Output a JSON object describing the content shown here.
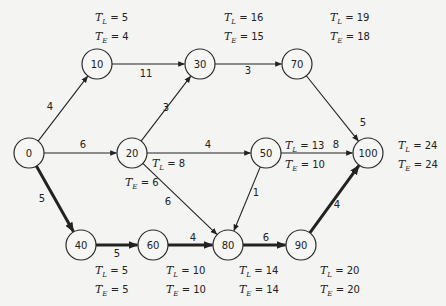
{
  "diagram": {
    "type": "PERT network",
    "nodes": [
      {
        "id": "0",
        "x": 29,
        "y": 153
      },
      {
        "id": "10",
        "x": 97,
        "y": 64
      },
      {
        "id": "20",
        "x": 132,
        "y": 153
      },
      {
        "id": "30",
        "x": 200,
        "y": 64
      },
      {
        "id": "40",
        "x": 81,
        "y": 245
      },
      {
        "id": "50",
        "x": 266,
        "y": 153
      },
      {
        "id": "60",
        "x": 153,
        "y": 245
      },
      {
        "id": "70",
        "x": 297,
        "y": 64
      },
      {
        "id": "80",
        "x": 228,
        "y": 245
      },
      {
        "id": "90",
        "x": 301,
        "y": 245
      },
      {
        "id": "100",
        "x": 368,
        "y": 153
      }
    ],
    "edges": [
      {
        "from": "0",
        "to": "10",
        "weight": "4",
        "critical": false,
        "lx": 50,
        "ly": 110
      },
      {
        "from": "0",
        "to": "20",
        "weight": "6",
        "critical": false,
        "lx": 83,
        "ly": 148
      },
      {
        "from": "0",
        "to": "40",
        "weight": "5",
        "critical": true,
        "lx": 42,
        "ly": 202
      },
      {
        "from": "10",
        "to": "30",
        "weight": "11",
        "critical": false,
        "lx": 146,
        "ly": 77
      },
      {
        "from": "20",
        "to": "30",
        "weight": "3",
        "critical": false,
        "lx": 166,
        "ly": 111
      },
      {
        "from": "20",
        "to": "50",
        "weight": "4",
        "critical": false,
        "lx": 208,
        "ly": 148
      },
      {
        "from": "20",
        "to": "80",
        "weight": "6",
        "critical": false,
        "lx": 168,
        "ly": 205
      },
      {
        "from": "30",
        "to": "70",
        "weight": "3",
        "critical": false,
        "lx": 248,
        "ly": 74
      },
      {
        "from": "70",
        "to": "100",
        "weight": "5",
        "critical": false,
        "lx": 363,
        "ly": 126
      },
      {
        "from": "50",
        "to": "100",
        "weight": "8",
        "critical": false,
        "lx": 336,
        "ly": 148
      },
      {
        "from": "50",
        "to": "80",
        "weight": "1",
        "critical": false,
        "lx": 256,
        "ly": 196
      },
      {
        "from": "40",
        "to": "60",
        "weight": "5",
        "critical": true,
        "lx": 117,
        "ly": 257
      },
      {
        "from": "60",
        "to": "80",
        "weight": "4",
        "critical": true,
        "lx": 193,
        "ly": 241
      },
      {
        "from": "80",
        "to": "90",
        "weight": "6",
        "critical": true,
        "lx": 266,
        "ly": 241
      },
      {
        "from": "90",
        "to": "100",
        "weight": "4",
        "critical": true,
        "lx": 337,
        "ly": 208
      }
    ],
    "times": [
      {
        "node": "10",
        "TL": "5",
        "TE": "4",
        "xL": 95,
        "yL": 21,
        "xE": 95,
        "yE": 40
      },
      {
        "node": "30",
        "TL": "16",
        "TE": "15",
        "xL": 224,
        "yL": 21,
        "xE": 224,
        "yE": 40
      },
      {
        "node": "70",
        "TL": "19",
        "TE": "18",
        "xL": 330,
        "yL": 21,
        "xE": 330,
        "yE": 40
      },
      {
        "node": "20",
        "TL": "8",
        "TE": "6",
        "xL": 152,
        "yL": 167,
        "xE": 125,
        "yE": 186
      },
      {
        "node": "50",
        "TL": "13",
        "TE": "10",
        "xL": 285,
        "yL": 149,
        "xE": 285,
        "yE": 168
      },
      {
        "node": "100",
        "TL": "24",
        "TE": "24",
        "xL": 398,
        "yL": 149,
        "xE": 398,
        "yE": 168
      },
      {
        "node": "40",
        "TL": "5",
        "TE": "5",
        "xL": 95,
        "yL": 274,
        "xE": 95,
        "yE": 293
      },
      {
        "node": "60",
        "TL": "10",
        "TE": "10",
        "xL": 166,
        "yL": 274,
        "xE": 166,
        "yE": 293
      },
      {
        "node": "80",
        "TL": "14",
        "TE": "14",
        "xL": 239,
        "yL": 274,
        "xE": 239,
        "yE": 293
      },
      {
        "node": "90",
        "TL": "20",
        "TE": "20",
        "xL": 320,
        "yL": 274,
        "xE": 320,
        "yE": 293
      }
    ],
    "labels": {
      "tl_symbol": "T",
      "tl_sub": "L",
      "te_symbol": "T",
      "te_sub": "E",
      "eq": " = "
    },
    "node_radius": 15,
    "colors": {
      "stroke": "#222222",
      "background": "#f4f4f2"
    }
  }
}
